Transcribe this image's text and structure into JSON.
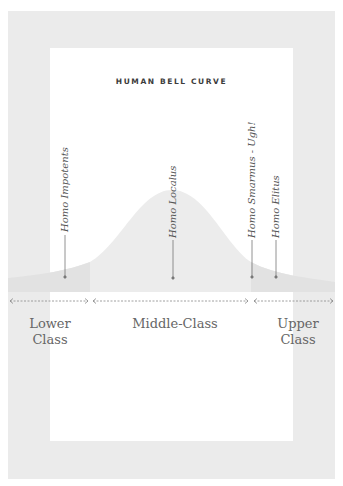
{
  "title": "HUMAN BELL CURVE",
  "species_labels": [
    {
      "text": "Homo Impotents",
      "x": 65
    },
    {
      "text": "Homo Localus",
      "x": 173
    },
    {
      "text": "Homo Smarmus - Ugh!",
      "x": 252
    },
    {
      "text": "Homo Elitus",
      "x": 276
    }
  ],
  "classes": [
    {
      "line1": "Lower",
      "line2": "Class"
    },
    {
      "line1": "Middle-Class",
      "line2": ""
    },
    {
      "line1": "Upper",
      "line2": "Class"
    }
  ],
  "colors": {
    "frame": "#ebebeb",
    "curve_fill": "#ececec",
    "tail_fill": "#e3e3e3",
    "line": "#777777"
  }
}
